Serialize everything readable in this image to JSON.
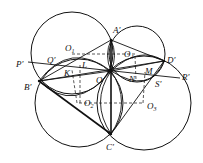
{
  "diagram": {
    "points": {
      "A": "A′",
      "B": "B′",
      "C": "C′",
      "D": "D′",
      "P": "P′",
      "Q": "Q′",
      "R": "R′",
      "S": "S′",
      "O": "O",
      "K": "K",
      "L": "L",
      "M": "M",
      "N": "N"
    },
    "centers": [
      {
        "base": "O",
        "sub": "1"
      },
      {
        "base": "O",
        "sub": "2"
      },
      {
        "base": "O",
        "sub": "3"
      },
      {
        "base": "O",
        "sub": "4"
      }
    ]
  }
}
